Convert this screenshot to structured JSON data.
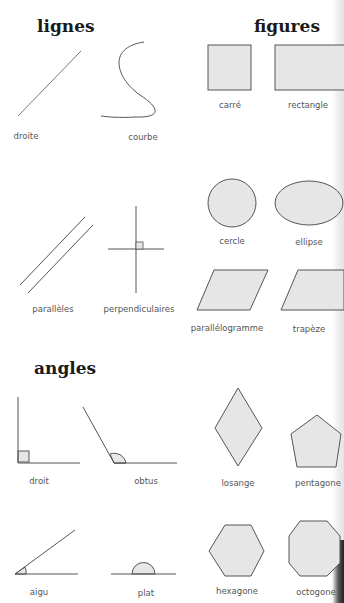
{
  "sections": {
    "lines": {
      "title": "lignes",
      "items": [
        {
          "label": "droite"
        },
        {
          "label": "courbe"
        },
        {
          "label": "parallèles"
        },
        {
          "label": "perpendiculaires"
        }
      ]
    },
    "figures": {
      "title": "figures",
      "items": [
        {
          "label": "carré"
        },
        {
          "label": "rectangle"
        },
        {
          "label": "cercle"
        },
        {
          "label": "ellipse"
        },
        {
          "label": "parallélogramme"
        },
        {
          "label": "trapèze"
        },
        {
          "label": "losange"
        },
        {
          "label": "pentagone"
        },
        {
          "label": "hexagone"
        },
        {
          "label": "octogone"
        }
      ]
    },
    "angles": {
      "title": "angles",
      "items": [
        {
          "label": "droit"
        },
        {
          "label": "obtus"
        },
        {
          "label": "aigu"
        },
        {
          "label": "plat"
        }
      ]
    }
  },
  "colors": {
    "stroke": "#555555",
    "fill": "#e6e6e6",
    "heading": "#1a1a1a",
    "label": "#555555"
  }
}
